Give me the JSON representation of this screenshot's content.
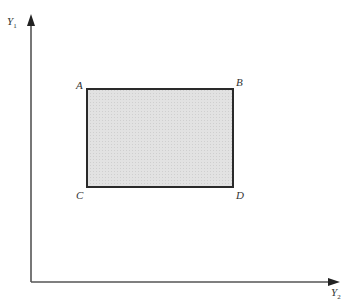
{
  "diagram": {
    "axes": {
      "vertical": {
        "label": "Y",
        "subscript": "1"
      },
      "horizontal": {
        "label": "Y",
        "subscript": "2"
      }
    },
    "rectangle": {
      "fill": "#dcdcdc",
      "stroke": "#222222",
      "corners": {
        "top_left": "A",
        "top_right": "B",
        "bottom_left": "C",
        "bottom_right": "D"
      }
    }
  }
}
